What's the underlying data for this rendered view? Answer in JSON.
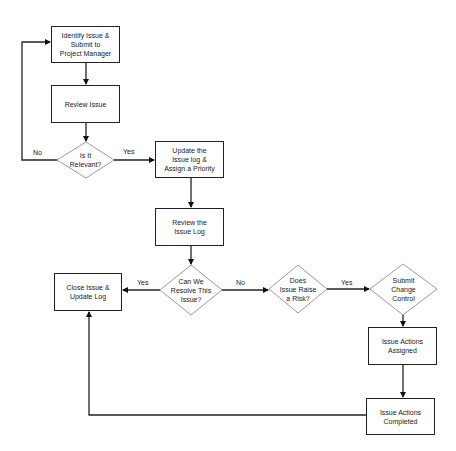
{
  "diagram": {
    "type": "flowchart",
    "nodes": {
      "identify": {
        "shape": "box",
        "label": "Identify Issue &\nSubmit to\nProject Manager"
      },
      "review_issue": {
        "shape": "box",
        "label": "Review Issue"
      },
      "is_relevant": {
        "shape": "diamond",
        "label": "Is It\nRelevant?"
      },
      "update_log": {
        "shape": "box",
        "label": "Update the\nIssue log &\nAssign a Priority"
      },
      "review_log": {
        "shape": "box",
        "label": "Review the\nIssue Log"
      },
      "can_resolve": {
        "shape": "diamond",
        "label": "Can We\nResolve This\nIssue?"
      },
      "close_issue": {
        "shape": "box",
        "label": "Close Issue &\nUpdate Log"
      },
      "raise_risk": {
        "shape": "diamond",
        "label": "Does\nIssue Raise\na Risk?"
      },
      "change_control": {
        "shape": "diamond",
        "label": "Submit\nChange\nControl"
      },
      "actions_assigned": {
        "shape": "box",
        "label": "Issue Actions\nAssigned"
      },
      "actions_completed": {
        "shape": "box",
        "label": "Issue Actions\nCompleted"
      }
    },
    "edges": [
      {
        "from": "identify",
        "to": "review_issue",
        "label": ""
      },
      {
        "from": "review_issue",
        "to": "is_relevant",
        "label": ""
      },
      {
        "from": "is_relevant",
        "to": "identify",
        "label": "No"
      },
      {
        "from": "is_relevant",
        "to": "update_log",
        "label": "Yes"
      },
      {
        "from": "update_log",
        "to": "review_log",
        "label": ""
      },
      {
        "from": "review_log",
        "to": "can_resolve",
        "label": ""
      },
      {
        "from": "can_resolve",
        "to": "close_issue",
        "label": "Yes"
      },
      {
        "from": "can_resolve",
        "to": "raise_risk",
        "label": "No"
      },
      {
        "from": "raise_risk",
        "to": "change_control",
        "label": "Yes"
      },
      {
        "from": "change_control",
        "to": "actions_assigned",
        "label": ""
      },
      {
        "from": "actions_assigned",
        "to": "actions_completed",
        "label": ""
      },
      {
        "from": "actions_completed",
        "to": "close_issue",
        "label": ""
      }
    ],
    "edge_labels": {
      "relevant_no": "No",
      "relevant_yes": "Yes",
      "resolve_yes": "Yes",
      "resolve_no": "No",
      "risk_yes": "Yes"
    },
    "colors": {
      "line": "#222222",
      "diamond_stroke": "#9a9a9a",
      "background": "#ffffff"
    }
  }
}
